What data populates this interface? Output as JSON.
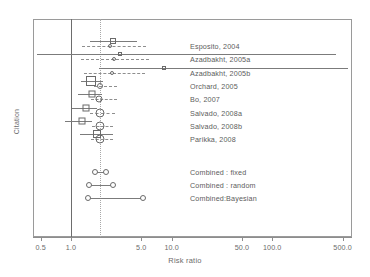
{
  "chart_data": {
    "type": "scatter",
    "plot_kind": "forest-plot",
    "title": "",
    "xlabel": "Risk ratio",
    "ylabel": "Citation",
    "xscale": "log",
    "xlim": [
      0.42,
      620
    ],
    "xticks": [
      0.5,
      1.0,
      5.0,
      10.0,
      50.0,
      100.0,
      500.0
    ],
    "xticklabels": [
      "0.5",
      "1.0",
      "5.0",
      "10.0",
      "50.0",
      "100.0",
      "500.0"
    ],
    "grid": false,
    "legend": "none",
    "reference_lines": [
      {
        "name": "null-effect",
        "value": 1.0,
        "style": "solid"
      },
      {
        "name": "pooled-estimate",
        "value": 1.95,
        "style": "dotted"
      }
    ],
    "series": [
      {
        "name": "Frequentist",
        "marker": "open-square",
        "line": "solid"
      },
      {
        "name": "Bayesian",
        "marker": "open-circle",
        "line": "dashed"
      }
    ],
    "studies": [
      {
        "label": "Esposito, 2004",
        "freq": {
          "est": 2.6,
          "lo": 1.55,
          "hi": 4.5,
          "box": 4
        },
        "bayes": {
          "est": 2.45,
          "lo": 1.3,
          "hi": 5.6,
          "dot": 2
        }
      },
      {
        "label": "Azadbakht, 2005a",
        "freq": {
          "est": 3.1,
          "lo": 0.46,
          "hi": 430.0,
          "box": 2
        },
        "bayes": {
          "est": 2.7,
          "lo": 1.25,
          "hi": 6.0,
          "dot": 2
        }
      },
      {
        "label": "Azadbakht, 2005b",
        "freq": {
          "est": 8.5,
          "lo": 1.9,
          "hi": 560.0,
          "box": 2
        },
        "bayes": {
          "est": 2.55,
          "lo": 1.35,
          "hi": 5.5,
          "dot": 2
        }
      },
      {
        "label": "Orchard, 2005",
        "freq": {
          "est": 1.6,
          "lo": 1.25,
          "hi": 2.1,
          "box": 8
        },
        "bayes": {
          "est": 1.95,
          "lo": 1.7,
          "hi": 2.9,
          "dot": 4
        }
      },
      {
        "label": "Bo, 2007",
        "freq": {
          "est": 1.62,
          "lo": 1.18,
          "hi": 2.05,
          "box": 5
        },
        "bayes": {
          "est": 1.9,
          "lo": 1.6,
          "hi": 2.85,
          "dot": 5
        }
      },
      {
        "label": "Salvado, 2008a",
        "freq": {
          "est": 1.42,
          "lo": 1.02,
          "hi": 1.8,
          "box": 5
        },
        "bayes": {
          "est": 1.95,
          "lo": 1.55,
          "hi": 2.75,
          "dot": 7
        }
      },
      {
        "label": "Salvado, 2008b",
        "freq": {
          "est": 1.28,
          "lo": 0.88,
          "hi": 1.62,
          "box": 5
        },
        "bayes": {
          "est": 1.96,
          "lo": 1.62,
          "hi": 2.6,
          "dot": 7
        }
      },
      {
        "label": "Parikka, 2008",
        "freq": {
          "est": 1.8,
          "lo": 1.22,
          "hi": 2.6,
          "box": 6
        },
        "bayes": {
          "est": 1.96,
          "lo": 1.6,
          "hi": 2.6,
          "dot": 7
        }
      }
    ],
    "combined": [
      {
        "label": "Combined : fixed",
        "est": 1.95,
        "lo": 1.72,
        "hi": 2.25
      },
      {
        "label": "Combined : random",
        "est": 1.95,
        "lo": 1.5,
        "hi": 2.6
      },
      {
        "label": "Combined:Bayesian",
        "est": 2.1,
        "lo": 1.48,
        "hi": 5.2
      }
    ]
  },
  "axes": {
    "y_title": "Citation",
    "x_title": "Risk ratio"
  }
}
